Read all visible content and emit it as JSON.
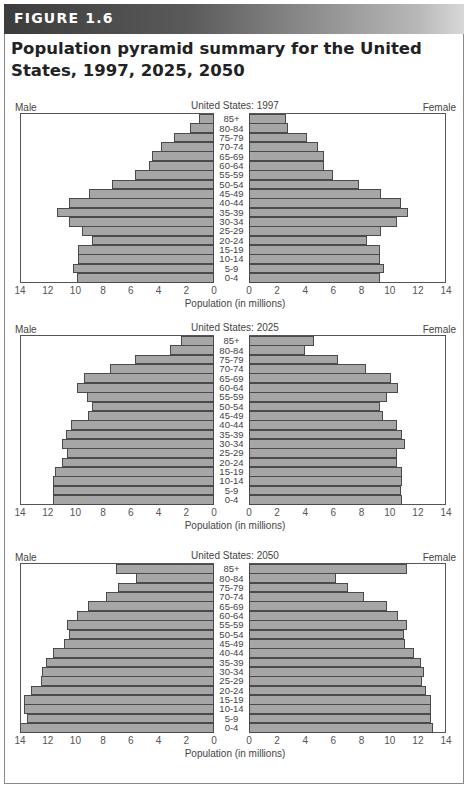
{
  "figure": {
    "label": "FIGURE 1.6",
    "title": "Population pyramid summary for the United States, 1997, 2025, 2050"
  },
  "common": {
    "male_label": "Male",
    "female_label": "Female",
    "xlabel": "Population (in millions)",
    "male_ticks": [
      "14",
      "12",
      "10",
      "8",
      "6",
      "4",
      "2",
      "0"
    ],
    "female_ticks": [
      "0",
      "2",
      "4",
      "6",
      "8",
      "10",
      "12",
      "14"
    ],
    "age_groups": [
      "85+",
      "80-84",
      "75-79",
      "70-74",
      "65-69",
      "60-64",
      "55-59",
      "50-54",
      "45-49",
      "40-44",
      "35-39",
      "30-34",
      "25-29",
      "20-24",
      "15-19",
      "10-14",
      "5-9",
      "0-4"
    ]
  },
  "colors": {
    "bar_fill": "#a6a6a6",
    "bar_border": "#4a4a4a",
    "banner_dark": "#3c3c3c"
  },
  "chart_data": [
    {
      "type": "bar",
      "orientation": "horizontal-pyramid",
      "title": "United States: 1997",
      "xlabel": "Population (in millions)",
      "xlim": [
        0,
        14
      ],
      "categories": [
        "85+",
        "80-84",
        "75-79",
        "70-74",
        "65-69",
        "60-64",
        "55-59",
        "50-54",
        "45-49",
        "40-44",
        "35-39",
        "30-34",
        "25-29",
        "20-24",
        "15-19",
        "10-14",
        "5-9",
        "0-4"
      ],
      "series": [
        {
          "name": "Male",
          "values": [
            1.1,
            1.7,
            2.9,
            3.8,
            4.5,
            4.7,
            5.7,
            7.4,
            9.0,
            10.5,
            11.3,
            10.5,
            9.5,
            8.8,
            9.8,
            9.8,
            10.2,
            9.9
          ]
        },
        {
          "name": "Female",
          "values": [
            2.6,
            2.8,
            4.1,
            4.9,
            5.3,
            5.3,
            6.0,
            7.8,
            9.4,
            10.8,
            11.3,
            10.5,
            9.4,
            8.4,
            9.3,
            9.3,
            9.6,
            9.3
          ]
        }
      ],
      "grid": false
    },
    {
      "type": "bar",
      "orientation": "horizontal-pyramid",
      "title": "United States: 2025",
      "xlabel": "Population (in millions)",
      "xlim": [
        0,
        14
      ],
      "categories": [
        "85+",
        "80-84",
        "75-79",
        "70-74",
        "65-69",
        "60-64",
        "55-59",
        "50-54",
        "45-49",
        "40-44",
        "35-39",
        "30-34",
        "25-29",
        "20-24",
        "15-19",
        "10-14",
        "5-9",
        "0-4"
      ],
      "series": [
        {
          "name": "Male",
          "values": [
            2.4,
            3.2,
            5.7,
            7.5,
            9.4,
            9.9,
            9.2,
            8.8,
            9.1,
            10.3,
            10.7,
            11.0,
            10.6,
            11.0,
            11.5,
            11.6,
            11.6,
            11.6
          ]
        },
        {
          "name": "Female",
          "values": [
            4.6,
            4.0,
            6.3,
            8.3,
            10.1,
            10.6,
            9.8,
            9.3,
            9.5,
            10.5,
            10.9,
            11.1,
            10.5,
            10.5,
            10.9,
            10.9,
            10.8,
            10.9
          ]
        }
      ],
      "grid": false
    },
    {
      "type": "bar",
      "orientation": "horizontal-pyramid",
      "title": "United States: 2050",
      "xlabel": "Population (in millions)",
      "xlim": [
        0,
        14
      ],
      "categories": [
        "85+",
        "80-84",
        "75-79",
        "70-74",
        "65-69",
        "60-64",
        "55-59",
        "50-54",
        "45-49",
        "40-44",
        "35-39",
        "30-34",
        "25-29",
        "20-24",
        "15-19",
        "10-14",
        "5-9",
        "0-4"
      ],
      "series": [
        {
          "name": "Male",
          "values": [
            7.1,
            5.6,
            6.9,
            7.8,
            9.1,
            9.9,
            10.6,
            10.5,
            10.8,
            11.6,
            12.1,
            12.4,
            12.5,
            13.2,
            13.7,
            13.7,
            13.5,
            14.0
          ]
        },
        {
          "name": "Female",
          "values": [
            11.2,
            6.2,
            7.0,
            8.2,
            9.8,
            10.6,
            11.2,
            11.0,
            11.1,
            11.7,
            12.2,
            12.4,
            12.3,
            12.6,
            12.9,
            12.9,
            12.9,
            13.1
          ]
        }
      ],
      "grid": false
    }
  ]
}
